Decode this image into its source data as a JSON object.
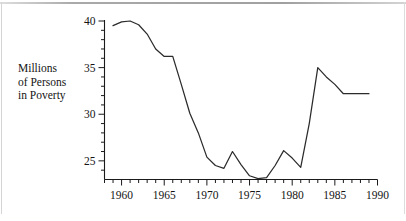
{
  "figure": {
    "y_axis_label_lines": [
      "Millions",
      "of Persons",
      "in Poverty"
    ],
    "axis_color": "#1a1a1a",
    "line_color": "#2b2b2b",
    "background": "#ffffff"
  },
  "chart_data": {
    "type": "line",
    "title": "",
    "xlabel": "",
    "ylabel": "Millions of Persons in Poverty",
    "xlim": [
      1958,
      1990
    ],
    "ylim": [
      23.5,
      40.5
    ],
    "grid": false,
    "legend": null,
    "xticks": [
      1960,
      1965,
      1970,
      1975,
      1980,
      1985,
      1990
    ],
    "xtick_labels": [
      "1960",
      "1965",
      "1970",
      "1975",
      "1980",
      "1985",
      "1990"
    ],
    "xminor_tick_step": 1,
    "yticks": [
      25,
      30,
      35,
      40
    ],
    "ytick_labels": [
      "25",
      "30",
      "35",
      "40"
    ],
    "yminor_tick_step": 1,
    "x": [
      1959,
      1960,
      1961,
      1962,
      1963,
      1964,
      1965,
      1966,
      1967,
      1968,
      1969,
      1970,
      1971,
      1972,
      1973,
      1974,
      1975,
      1976,
      1977,
      1978,
      1979,
      1980,
      1981,
      1982,
      1983,
      1984,
      1985,
      1986,
      1987,
      1988,
      1989
    ],
    "values": [
      39.5,
      39.9,
      40.0,
      39.6,
      38.6,
      37.0,
      36.2,
      36.2,
      33.2,
      30.1,
      28.0,
      25.4,
      24.5,
      24.2,
      26.0,
      24.6,
      23.4,
      23.1,
      23.2,
      24.5,
      26.1,
      25.3,
      24.3,
      29.0,
      35.0,
      34.0,
      33.2,
      32.2,
      32.2,
      32.2,
      32.2
    ],
    "series_name": "Persons in Poverty (millions)"
  }
}
